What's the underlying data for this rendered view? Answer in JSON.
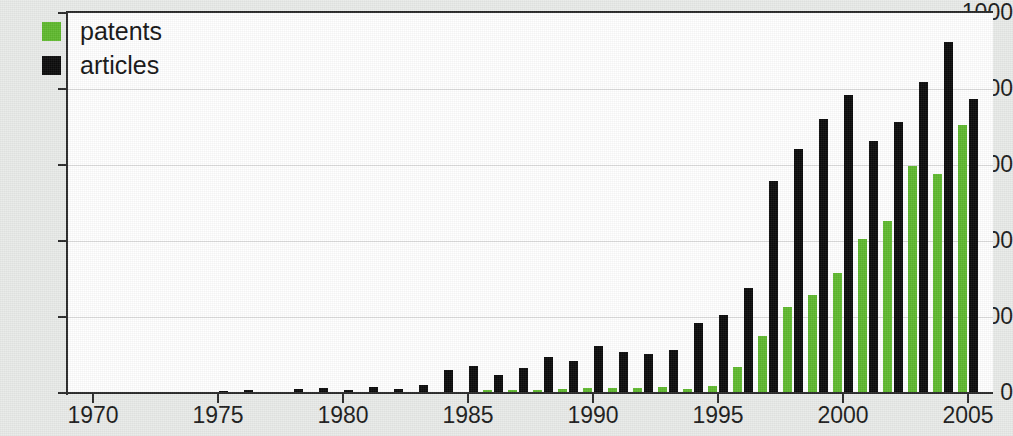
{
  "chart_data": {
    "type": "bar",
    "title": "",
    "subtitle": "",
    "xlabel": "",
    "ylabel": "",
    "ylim": [
      0,
      1000
    ],
    "ytick_values": [
      0,
      200,
      400,
      600,
      800,
      1000
    ],
    "ytick_labels": [
      "0",
      "200",
      "400",
      "600",
      "800",
      "1000"
    ],
    "xlim": [
      1969,
      2006
    ],
    "xtick_values": [
      1970,
      1975,
      1980,
      1985,
      1990,
      1995,
      2000,
      2005
    ],
    "xtick_labels": [
      "1970",
      "1975",
      "1980",
      "1985",
      "1990",
      "1995",
      "2000",
      "2005"
    ],
    "grid": true,
    "grid_axis": "y",
    "legend_position": "top-left",
    "categories": [
      1970,
      1971,
      1972,
      1973,
      1974,
      1975,
      1976,
      1977,
      1978,
      1979,
      1980,
      1981,
      1982,
      1983,
      1984,
      1985,
      1986,
      1987,
      1988,
      1989,
      1990,
      1991,
      1992,
      1993,
      1994,
      1995,
      1996,
      1997,
      1998,
      1999,
      2000,
      2001,
      2002,
      2003,
      2004,
      2005
    ],
    "series": [
      {
        "name": "patents",
        "color": "#5fb92e",
        "values": [
          0,
          0,
          0,
          0,
          0,
          0,
          0,
          0,
          0,
          0,
          0,
          0,
          0,
          0,
          2,
          3,
          9,
          8,
          9,
          11,
          13,
          14,
          13,
          16,
          10,
          18,
          68,
          150,
          226,
          259,
          315,
          406,
          452,
          598,
          577,
          706
        ]
      },
      {
        "name": "articles",
        "color": "#0b0b0b",
        "values": [
          0,
          0,
          0,
          1,
          3,
          6,
          8,
          3,
          11,
          13,
          8,
          17,
          11,
          21,
          60,
          70,
          47,
          67,
          95,
          85,
          125,
          107,
          103,
          112,
          185,
          205,
          277,
          559,
          643,
          721,
          784,
          662,
          713,
          818,
          925,
          775
        ]
      }
    ]
  },
  "legend": {
    "items": [
      {
        "label": "patents",
        "color": "#5fb92e"
      },
      {
        "label": "articles",
        "color": "#0b0b0b"
      }
    ]
  },
  "colors": {
    "patents": "#5fb92e",
    "articles": "#0b0b0b",
    "axis": "#2a2a2a",
    "grid": "#dcdcdc",
    "plot_background": "#ffffff",
    "figure_background": "#e9ebe9"
  }
}
